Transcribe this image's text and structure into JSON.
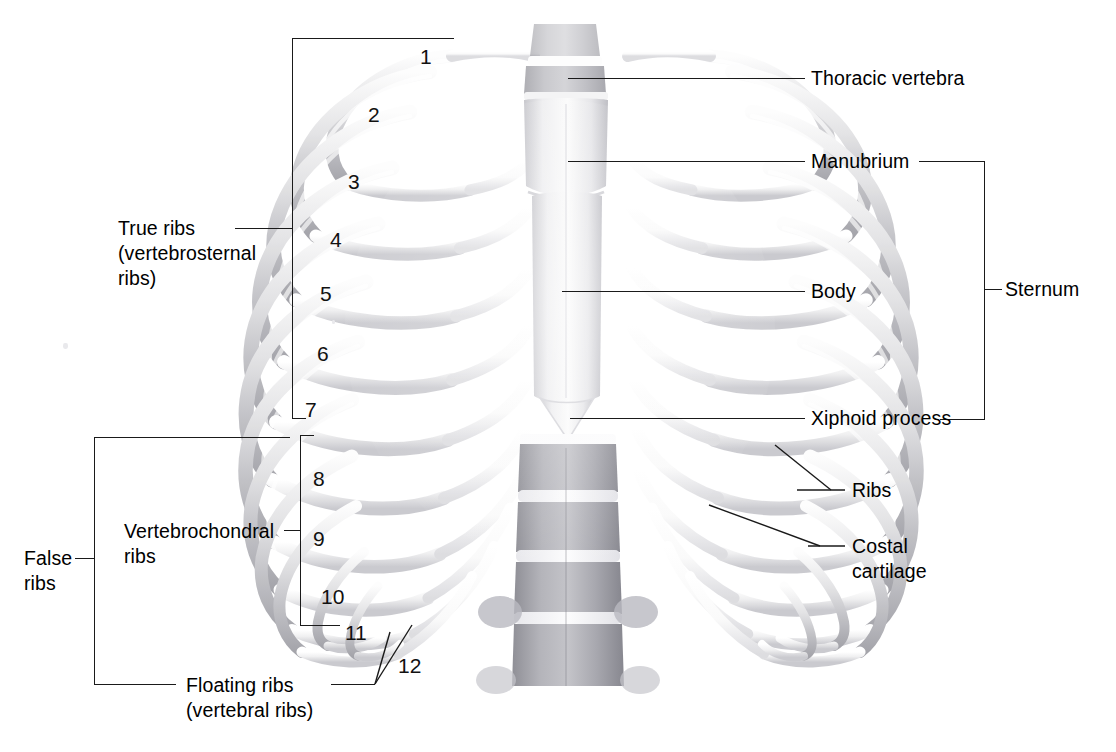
{
  "figure": {
    "background_color": "#ffffff",
    "line_color": "#1a1a1a",
    "text_color": "#000000"
  },
  "labels": {
    "true_ribs_line1": "True ribs",
    "true_ribs_line2": "(vertebrosternal",
    "true_ribs_line3": "ribs)",
    "false_ribs_line1": "False",
    "false_ribs_line2": "ribs",
    "vertebrochondral_line1": "Vertebrochondral",
    "vertebrochondral_line2": "ribs",
    "floating_ribs_line1": "Floating ribs",
    "floating_ribs_line2": "(vertebral ribs)",
    "thoracic_vertebra": "Thoracic vertebra",
    "manubrium": "Manubrium",
    "body": "Body",
    "xiphoid_process": "Xiphoid process",
    "sternum": "Sternum",
    "ribs": "Ribs",
    "costal_cartilage_line1": "Costal",
    "costal_cartilage_line2": "cartilage"
  },
  "rib_numbers": [
    {
      "n": "1",
      "x": 420,
      "y": 46
    },
    {
      "n": "2",
      "x": 368,
      "y": 104
    },
    {
      "n": "3",
      "x": 348,
      "y": 171
    },
    {
      "n": "4",
      "x": 330,
      "y": 229
    },
    {
      "n": "5",
      "x": 320,
      "y": 283
    },
    {
      "n": "6",
      "x": 317,
      "y": 343
    },
    {
      "n": "7",
      "x": 305,
      "y": 399
    },
    {
      "n": "8",
      "x": 313,
      "y": 468
    },
    {
      "n": "9",
      "x": 313,
      "y": 528
    },
    {
      "n": "10",
      "x": 321,
      "y": 586
    },
    {
      "n": "11",
      "x": 345,
      "y": 622
    },
    {
      "n": "12",
      "x": 398,
      "y": 655
    }
  ],
  "anatomy": {
    "true_ribs_range": "1-7",
    "vertebrochondral_ribs_range": "8-10",
    "floating_ribs_range": "11-12",
    "false_ribs_range": "8-12",
    "sternum_parts": [
      "Manubrium",
      "Body",
      "Xiphoid process"
    ],
    "total_rib_pairs": 12
  },
  "colors": {
    "bone_light": "#fbfbfb",
    "bone_mid": "#d8d8da",
    "bone_shadow": "#a9a9ae",
    "cartilage": "#f2f2f3",
    "vertebra_dark": "#9e9ea4"
  }
}
